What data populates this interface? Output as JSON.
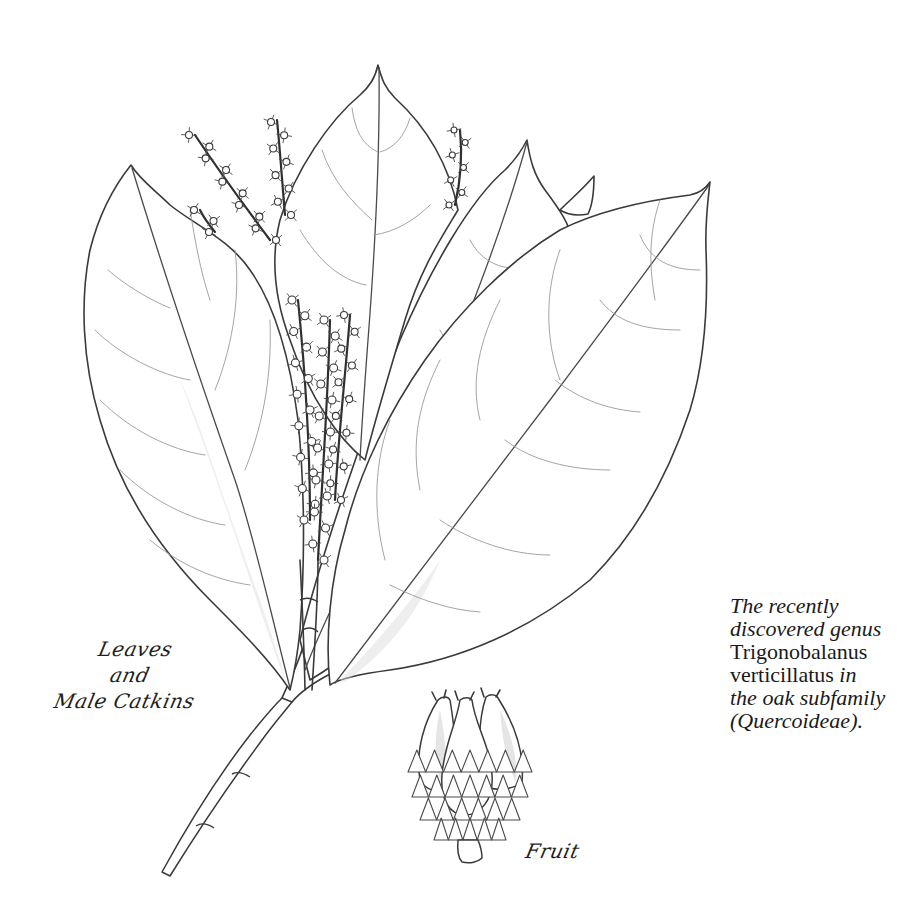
{
  "illustration": {
    "subject": "Trigonobalanus verticillatus botanical drawing",
    "ink_color": "#3a3a3a",
    "background_color": "#ffffff"
  },
  "labels": {
    "leaves_and_catkins": [
      "Leaves",
      "and",
      "Male Catkins"
    ],
    "fruit": "Fruit"
  },
  "caption": {
    "line1": "The recently",
    "line2": "discovered genus",
    "line3": "Trigonobalanus",
    "line4_roman": "verticillatus",
    "line4_italic": " in",
    "line5": "the oak subfamily",
    "line6": "(Quercoideae)."
  }
}
